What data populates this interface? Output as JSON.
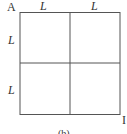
{
  "diagram": {
    "corner_top_left": "A",
    "corner_bottom_right": "I",
    "top_labels": [
      "L",
      "L"
    ],
    "left_labels": [
      "L",
      "L"
    ],
    "caption": "(b)",
    "line_color": "#555555"
  }
}
